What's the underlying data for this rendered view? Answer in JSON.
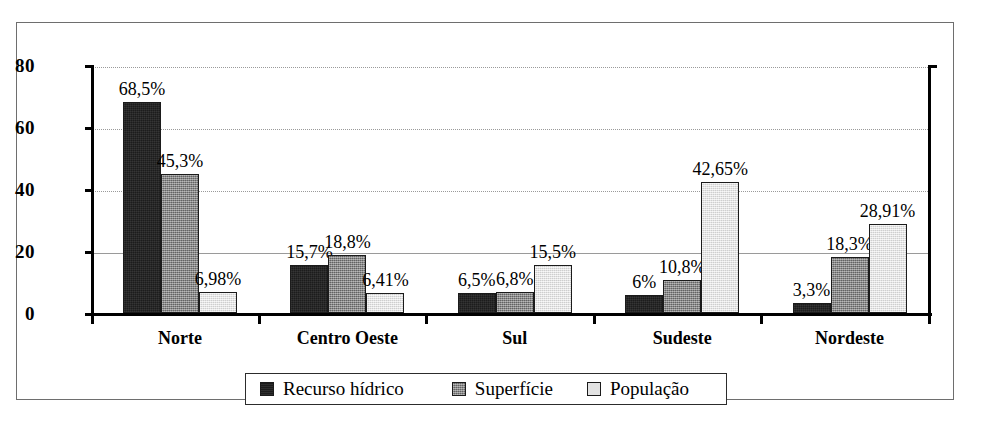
{
  "chart_data": {
    "type": "bar",
    "title": "",
    "subtitle": "",
    "xlabel": "",
    "ylabel": "",
    "ylim": [
      0,
      80
    ],
    "yticks": [
      0,
      20,
      40,
      60,
      80
    ],
    "ytick_labels": [
      "0",
      "20",
      "40",
      "60",
      "80"
    ],
    "grid": true,
    "legend_position": "bottom",
    "categories": [
      "Norte",
      "Centro Oeste",
      "Sul",
      "Sudeste",
      "Nordeste"
    ],
    "series": [
      {
        "name": "Recurso hídrico",
        "color": "#1c1c1c",
        "values": [
          68.5,
          15.7,
          6.5,
          6.0,
          3.3
        ],
        "labels": [
          "68,5%",
          "15,7%",
          "6,5%",
          "6%",
          "3,3%"
        ]
      },
      {
        "name": "Superfície",
        "color": "#7d7d7d",
        "values": [
          45.3,
          18.8,
          6.8,
          10.8,
          18.3
        ],
        "labels": [
          "45,3%",
          "18,8%",
          "6,8%",
          "10,8%",
          "18,3%"
        ]
      },
      {
        "name": "População",
        "color": "#e2e2e2",
        "values": [
          6.98,
          6.41,
          15.5,
          42.65,
          28.91
        ],
        "labels": [
          "6,98%",
          "6,41%",
          "15,5%",
          "42,65%",
          "28,91%"
        ]
      }
    ]
  },
  "legend": {
    "items": [
      {
        "label": "Recurso hídrico",
        "swatch": "dark-swatch"
      },
      {
        "label": "Superfície",
        "swatch": "medium-gray-swatch"
      },
      {
        "label": "População",
        "swatch": "light-gray-swatch"
      }
    ]
  }
}
